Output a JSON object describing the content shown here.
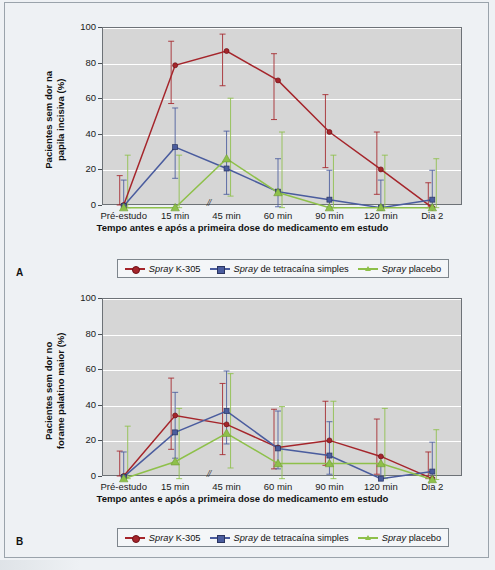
{
  "figure": {
    "background_color": "#eef1f4",
    "plot_background_color": "#d6d6d6",
    "gridline_color": "#ffffff"
  },
  "series_colors": {
    "spray_k305": "#a5252b",
    "spray_tetracaina": "#4a5c9e",
    "spray_placebo": "#8ec04a"
  },
  "legend": {
    "items": [
      {
        "name": "spray-k305",
        "emphasis": "Spray",
        "rest": " K-305",
        "color": "#a5252b",
        "marker": "circle"
      },
      {
        "name": "spray-tetracaina",
        "emphasis": "Spray",
        "rest": " de tetracaína simples",
        "color": "#4a5c9e",
        "marker": "square"
      },
      {
        "name": "spray-placebo",
        "emphasis": "Spray",
        "rest": " placebo",
        "color": "#8ec04a",
        "marker": "triangle"
      }
    ]
  },
  "panels": [
    {
      "letter": "A",
      "ylabel": "Pacientes sem dor na\npapila incisiva (%)",
      "xlabel": "Tempo antes e após a primeira dose do medicamento em estudo"
    },
    {
      "letter": "B",
      "ylabel": "Pacientes sem dor no\nforame palatino maior (%)",
      "xlabel": "Tempo antes e após a primeira dose do medicamento em estudo"
    }
  ],
  "axis_break_symbol": "//",
  "chart_data": [
    {
      "panel": "A",
      "type": "line",
      "title": "",
      "xlabel": "Tempo antes e após a primeira dose do medicamento em estudo",
      "ylabel": "Pacientes sem dor na papila incisiva (%)",
      "categories": [
        "Pré-estudo",
        "15 min",
        "45 min",
        "60 min",
        "90 min",
        "120 min",
        "Dia 2"
      ],
      "ylim": [
        0,
        100
      ],
      "yticks": [
        0,
        20,
        40,
        60,
        80,
        100
      ],
      "grid": true,
      "legend_position": "below",
      "axis_break_after_category": "15 min",
      "series": [
        {
          "name": "Spray K-305",
          "color": "#a5252b",
          "marker": "circle",
          "values": [
            0,
            78.5,
            86.5,
            70,
            41,
            20,
            -1.5
          ],
          "err_low": [
            0,
            57,
            67,
            48,
            21,
            6,
            -1.5
          ],
          "err_high": [
            16.5,
            92,
            96,
            85,
            62,
            41,
            12.5
          ]
        },
        {
          "name": "Spray de tetracaína simples",
          "color": "#4a5c9e",
          "marker": "square",
          "values": [
            -0.5,
            32.5,
            20.5,
            7.5,
            3,
            -1.5,
            3
          ],
          "err_low": [
            -0.5,
            15,
            6,
            -1,
            -1,
            -1.5,
            -1
          ],
          "err_high": [
            14,
            54.5,
            41.5,
            26,
            19.5,
            14,
            19.5
          ]
        },
        {
          "name": "Spray placebo",
          "color": "#8ec04a",
          "marker": "triangle",
          "values": [
            -1.5,
            -1.5,
            26,
            7,
            -1.5,
            -1.5,
            -1.5
          ],
          "err_low": [
            -1.5,
            -1.5,
            5,
            -1.5,
            -1.5,
            -1.5,
            -1.5
          ],
          "err_high": [
            28,
            28,
            60,
            41,
            28,
            28,
            26
          ]
        }
      ]
    },
    {
      "panel": "B",
      "type": "line",
      "title": "",
      "xlabel": "Tempo antes e após a primeira dose do medicamento em estudo",
      "ylabel": "Pacientes sem dor no forame palatino maior (%)",
      "categories": [
        "Pré-estudo",
        "15 min",
        "45 min",
        "60 min",
        "90 min",
        "120 min",
        "Dia 2"
      ],
      "ylim": [
        0,
        100
      ],
      "yticks": [
        0,
        20,
        40,
        60,
        80,
        100
      ],
      "grid": true,
      "legend_position": "below",
      "axis_break_after_category": "15 min",
      "series": [
        {
          "name": "Spray K-305",
          "color": "#a5252b",
          "marker": "circle",
          "values": [
            0,
            34,
            29,
            16,
            20,
            11,
            -1.5
          ],
          "err_low": [
            0,
            15,
            12,
            4,
            6,
            1,
            -1.5
          ],
          "err_high": [
            14,
            55,
            52,
            37.5,
            42,
            32,
            13.5
          ]
        },
        {
          "name": "Spray de tetracaína simples",
          "color": "#4a5c9e",
          "marker": "square",
          "values": [
            -0.5,
            24.5,
            36.5,
            15.5,
            11.5,
            -1.5,
            2.5
          ],
          "err_low": [
            -0.5,
            10,
            18,
            4,
            1,
            -1.5,
            -1
          ],
          "err_high": [
            13.5,
            47,
            59,
            36.5,
            30.5,
            11,
            19
          ]
        },
        {
          "name": "Spray placebo",
          "color": "#8ec04a",
          "marker": "triangle",
          "values": [
            -1.5,
            8,
            24,
            7,
            7,
            7,
            -2
          ],
          "err_low": [
            -1.5,
            -1.5,
            4.5,
            -1.5,
            -1.5,
            -1.5,
            -2
          ],
          "err_high": [
            28,
            38,
            57.5,
            39,
            42,
            38,
            26
          ]
        }
      ]
    }
  ]
}
